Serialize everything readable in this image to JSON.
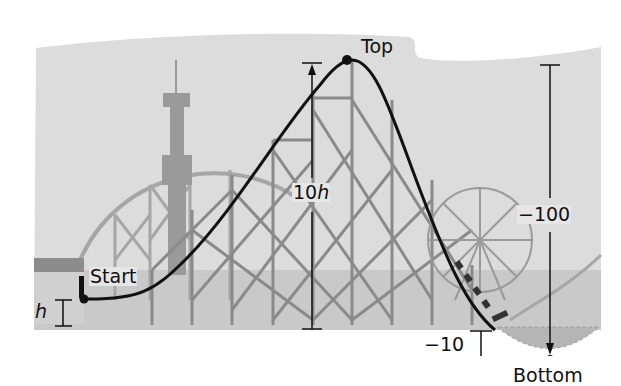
{
  "diagram": {
    "labels": {
      "top": "Top",
      "start": "Start",
      "bottom": "Bottom",
      "start_height": "h",
      "climb_height_coef": "10",
      "climb_height_var": "h",
      "drop_total": "−100",
      "below_ground": "−10"
    },
    "points": [
      {
        "name": "Start",
        "x": 84,
        "y": 299
      },
      {
        "name": "Top",
        "x": 347,
        "y": 60
      },
      {
        "name": "Bottom",
        "x": 550,
        "y": 360
      }
    ],
    "colors": {
      "sky": "#dcdcdc",
      "ground": "#c8c8c8",
      "structure": "#8e8e8e",
      "track": "#111111",
      "text": "#111111"
    }
  }
}
